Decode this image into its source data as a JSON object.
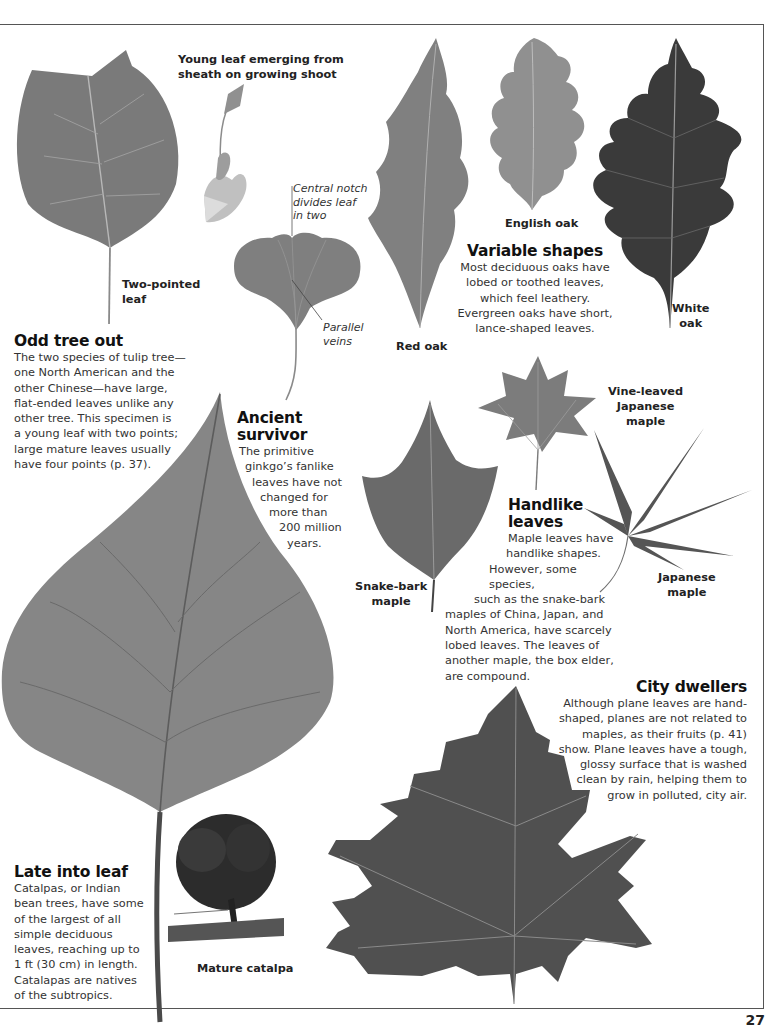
{
  "page": {
    "number": "27",
    "colors": {
      "leaf_light": "#8a8a8a",
      "leaf_mid": "#6e6e6e",
      "leaf_dark": "#3a3a3a",
      "text": "#333333",
      "heading": "#111111",
      "frame": "#555555"
    }
  },
  "tulip_tree": {
    "young_leaf_caption": "Young leaf emerging from sheath on growing shoot",
    "young_leaf_caption_lines": [
      "Young leaf emerging from",
      "sheath on growing shoot"
    ],
    "leaf_label_lines": [
      "Two-pointed",
      "leaf"
    ],
    "heading": "Odd tree out",
    "body_lines": [
      "The two species of tulip tree—",
      "one North American and the",
      "other Chinese—have large,",
      "flat-ended leaves unlike any",
      "other tree. This specimen is",
      "a young leaf with two points;",
      "large mature leaves usually",
      "have four points (p. 37)."
    ]
  },
  "ginkgo": {
    "notch_note_lines": [
      "Central notch",
      "divides leaf",
      "in two"
    ],
    "veins_note_lines": [
      "Parallel",
      "veins"
    ],
    "heading_lines": [
      "Ancient",
      "survivor"
    ],
    "body_lines": [
      "The primitive",
      "ginkgo’s fanlike",
      "leaves have not",
      "changed for",
      "more than",
      "200 million",
      "years."
    ]
  },
  "oaks": {
    "red_oak_label": "Red oak",
    "english_oak_label": "English oak",
    "white_oak_label_lines": [
      "White",
      "oak"
    ],
    "heading": "Variable shapes",
    "body_lines": [
      "Most deciduous oaks have",
      "lobed or toothed leaves,",
      "which feel leathery.",
      "Evergreen oaks have short,",
      "lance-shaped leaves."
    ]
  },
  "maples": {
    "vine_leaved_label_lines": [
      "Vine-leaved",
      "Japanese",
      "maple"
    ],
    "japanese_label_lines": [
      "Japanese",
      "maple"
    ],
    "snake_bark_label_lines": [
      "Snake-bark",
      "maple"
    ],
    "heading_lines": [
      "Handlike",
      "leaves"
    ],
    "body_lines": [
      "Maple leaves have",
      "handlike shapes.",
      "However, some species,",
      "such as the snake-bark",
      "maples of China, Japan, and",
      "North America, have scarcely",
      "lobed leaves. The leaves of",
      "another maple, the box elder,",
      "are compound."
    ]
  },
  "plane": {
    "heading": "City dwellers",
    "body_lines": [
      "Although plane leaves are hand-",
      "shaped, planes are not related to",
      "maples, as their fruits (p. 41)",
      "show. Plane leaves have a tough,",
      "glossy surface that is washed",
      "clean by rain, helping them to",
      "grow in polluted, city air."
    ]
  },
  "catalpa": {
    "tree_label": "Mature catalpa",
    "heading": "Late into leaf",
    "body_lines": [
      "Catalpas, or Indian",
      "bean trees, have some",
      "of the largest of all",
      "simple deciduous",
      "leaves, reaching up to",
      "1 ft (30 cm) in length.",
      "Catalapas are natives",
      "of the subtropics."
    ]
  }
}
